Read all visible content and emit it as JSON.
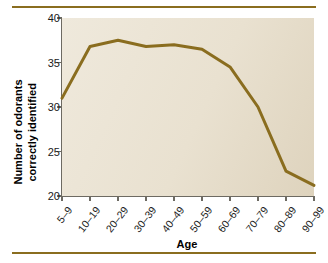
{
  "chart_data": {
    "type": "line",
    "title": "",
    "xlabel": "Age",
    "ylabel_line1": "Number of odorants",
    "ylabel_line2": "correctly identified",
    "categories": [
      "5–9",
      "10–19",
      "20–29",
      "30–39",
      "40–49",
      "50–59",
      "60–69",
      "70–79",
      "80–89",
      "90–99"
    ],
    "values": [
      31.0,
      36.8,
      37.5,
      36.8,
      37.0,
      36.5,
      34.5,
      30.0,
      22.8,
      21.2
    ],
    "series": [
      {
        "name": "Odorants correctly identified",
        "values": [
          31.0,
          36.8,
          37.5,
          36.8,
          37.0,
          36.5,
          34.5,
          30.0,
          22.8,
          21.2
        ]
      }
    ],
    "ylim": [
      20,
      40
    ],
    "yticks": [
      20,
      25,
      30,
      35,
      40
    ],
    "ytick_labels": [
      "20",
      "25",
      "30",
      "35",
      "40"
    ],
    "xlim": [
      0,
      9
    ],
    "grid": false,
    "legend": false,
    "line_color": "#8a6d1f",
    "line_width": 3,
    "plot_background": "#ece5d6",
    "axis_color": "#6d6a62",
    "rule_color": "#8a6d1f"
  }
}
